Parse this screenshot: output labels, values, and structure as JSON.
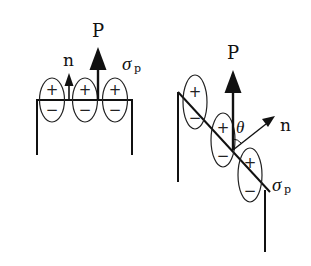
{
  "diagram": {
    "left": {
      "labels": {
        "polarization": "P",
        "normal": "n",
        "surface_charge": "σ",
        "surface_charge_sub": "p"
      },
      "dipoles": [
        {
          "top": "+",
          "bottom": "−"
        },
        {
          "top": "+",
          "bottom": "−"
        },
        {
          "top": "+",
          "bottom": "−"
        }
      ]
    },
    "right": {
      "labels": {
        "polarization": "P",
        "normal": "n",
        "angle": "θ",
        "surface_charge": "σ",
        "surface_charge_sub": "p"
      },
      "dipoles": [
        {
          "top": "+",
          "bottom": "−"
        },
        {
          "top": "+",
          "bottom": "−"
        },
        {
          "top": "+",
          "bottom": "−"
        }
      ]
    },
    "colors": {
      "stroke": "#111111",
      "background": "#ffffff"
    }
  }
}
